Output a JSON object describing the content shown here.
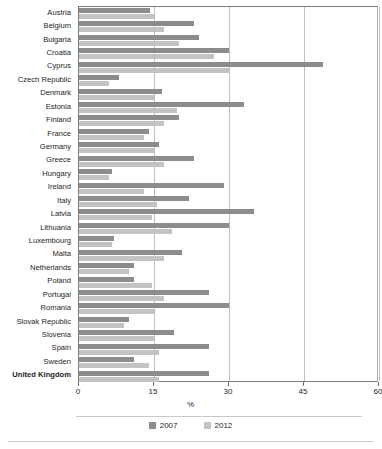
{
  "chart_data": {
    "type": "bar",
    "orientation": "horizontal",
    "title": "",
    "xlabel": "%",
    "ylabel": "",
    "xlim": [
      0,
      60
    ],
    "xticks": [
      0,
      15,
      30,
      45,
      60
    ],
    "xtick_labels": [
      "0",
      "15",
      "30",
      "45",
      "60"
    ],
    "grid": "vertical",
    "legend_position": "bottom",
    "highlight_category": "United Kingdom",
    "categories": [
      "Austria",
      "Belgium",
      "Bulgaria",
      "Croatia",
      "Cyprus",
      "Czech Republic",
      "Denmark",
      "Estonia",
      "Finland",
      "France",
      "Germany",
      "Greece",
      "Hungary",
      "Ireland",
      "Italy",
      "Latvia",
      "Lithuania",
      "Luxembourg",
      "Malta",
      "Netherlands",
      "Poland",
      "Portugal",
      "Romania",
      "Slovak Republic",
      "Slovenia",
      "Spain",
      "Sweden",
      "United Kingdom"
    ],
    "series": [
      {
        "name": "2007",
        "color": "#8c8c8c",
        "values": [
          14.2,
          23.0,
          24.0,
          30.0,
          48.8,
          8.0,
          16.5,
          33.0,
          20.0,
          14.0,
          16.0,
          23.0,
          6.5,
          29.0,
          22.0,
          35.0,
          30.0,
          7.0,
          20.5,
          11.0,
          11.0,
          26.0,
          30.0,
          10.0,
          19.0,
          26.0,
          11.0,
          26.0
        ]
      },
      {
        "name": "2012",
        "color": "#c3c3c3",
        "values": [
          15.0,
          17.0,
          20.0,
          27.0,
          30.0,
          6.0,
          15.0,
          19.5,
          17.0,
          13.0,
          15.0,
          17.0,
          6.0,
          13.0,
          15.5,
          14.5,
          18.5,
          6.5,
          17.0,
          10.0,
          14.5,
          17.0,
          15.0,
          9.0,
          15.0,
          16.0,
          14.0,
          16.0
        ]
      }
    ]
  },
  "legend": {
    "items": [
      {
        "label": "2007",
        "color": "#8c8c8c"
      },
      {
        "label": "2012",
        "color": "#c3c3c3"
      }
    ]
  },
  "axis": {
    "x_title": "%"
  }
}
